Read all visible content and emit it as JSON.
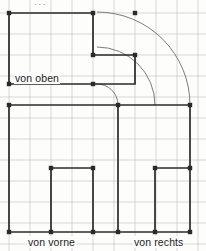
{
  "sheet": {
    "width": 206,
    "height": 251,
    "paper_color": "#fdfdfb",
    "grid_color": "#bdbdbd",
    "outline_color": "#2a2a2a",
    "arc_color": "#6d6d6d",
    "grid_step": 21,
    "grid_origin_x": 9,
    "grid_origin_y": 13,
    "top_artifact": "..."
  },
  "labels": [
    {
      "id": "view-top",
      "text": "von oben",
      "x": 14,
      "y": 72
    },
    {
      "id": "view-front",
      "text": "von vorne",
      "x": 27,
      "y": 236
    },
    {
      "id": "view-right",
      "text": "von rechts",
      "x": 133,
      "y": 236
    }
  ],
  "drawing": {
    "type": "orthographic-projection",
    "views": [
      "von oben",
      "von vorne",
      "von rechts"
    ],
    "polylines": [
      {
        "id": "top-view-outline",
        "points": "9,13 93,13 93,55 135,55 135,84 9,84 9,13"
      },
      {
        "id": "plan-divider",
        "points": "9,105 190,105"
      },
      {
        "id": "front-view-left-edge",
        "points": "9,105 9,232"
      },
      {
        "id": "front-view-mid-step",
        "points": "51,232 51,168 93,168"
      },
      {
        "id": "front-view-right-edge",
        "points": "93,168 93,232"
      },
      {
        "id": "right-view-left-edge",
        "points": "118,105 118,232"
      },
      {
        "id": "right-view-step",
        "points": "155,232 155,168 190,168"
      },
      {
        "id": "right-view-right-edge",
        "points": "190,105 190,232"
      },
      {
        "id": "baseline",
        "points": "9,232 190,232"
      }
    ],
    "arcs": [
      {
        "id": "arc-small",
        "cx": 118,
        "cy": 84,
        "r": 21,
        "from": "96,84",
        "to": "118,105"
      },
      {
        "id": "arc-medium",
        "cx": 97,
        "cy": 105,
        "r": 58,
        "from": "97,47",
        "to": "155,105"
      },
      {
        "id": "arc-large",
        "cx": 97,
        "cy": 105,
        "r": 93,
        "from": "97,12",
        "to": "190,105"
      }
    ],
    "vertices": [
      "9,13",
      "93,13",
      "135,13",
      "93,55",
      "135,55",
      "9,84",
      "93,84",
      "9,105",
      "118,105",
      "190,105",
      "51,168",
      "93,168",
      "155,168",
      "190,168",
      "9,232",
      "51,232",
      "93,232",
      "118,232",
      "155,232",
      "190,232"
    ]
  }
}
